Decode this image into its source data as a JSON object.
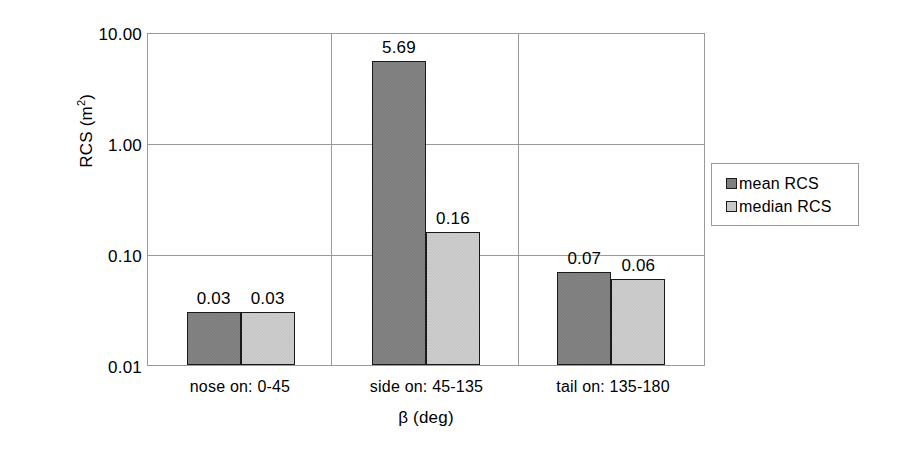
{
  "chart_data": {
    "type": "bar",
    "title": "",
    "xlabel": "β (deg)",
    "ylabel": "RCS (m²)",
    "ylabel_base": "RCS (m",
    "ylabel_sup": "2",
    "ylabel_close": ")",
    "yscale": "log",
    "ylim": [
      0.01,
      10.0
    ],
    "ytick_labels": [
      "10.00",
      "1.00",
      "0.10",
      "0.01"
    ],
    "ytick_values": [
      10.0,
      1.0,
      0.1,
      0.01
    ],
    "grid": "horizontal-and-category-separators",
    "legend_position": "right",
    "categories": [
      "nose on:  0-45",
      "side on: 45-135",
      "tail on: 135-180"
    ],
    "series": [
      {
        "name": "mean RCS",
        "color": "#7f7f7f",
        "values": [
          0.03,
          5.69,
          0.07
        ],
        "labels": [
          "0.03",
          "5.69",
          "0.07"
        ]
      },
      {
        "name": "median RCS",
        "color": "#c9c9c9",
        "values": [
          0.03,
          0.16,
          0.06
        ],
        "labels": [
          "0.03",
          "0.16",
          "0.06"
        ]
      }
    ]
  },
  "legend": {
    "items": [
      {
        "label": "mean RCS",
        "color": "#7f7f7f"
      },
      {
        "label": "median RCS",
        "color": "#c9c9c9"
      }
    ]
  },
  "colors": {
    "mean": "#7f7f7f",
    "median": "#c9c9c9",
    "axis": "#9a9a9a",
    "bar_outline": "#1a1a1a",
    "background": "#ffffff",
    "text": "#000000"
  }
}
